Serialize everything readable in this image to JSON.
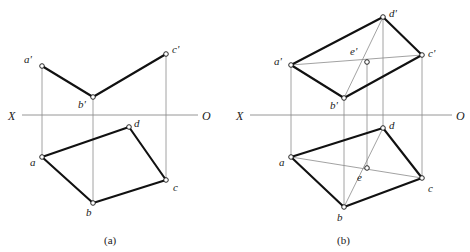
{
  "figure": {
    "colors": {
      "line_heavy": "#111111",
      "line_light": "#8a8a8a",
      "vertex_fill": "#ffffff",
      "vertex_stroke": "#111111",
      "text": "#1a1a1a"
    },
    "captions": [
      {
        "id": "caption-a",
        "text": "(a)",
        "x": 104,
        "y": 235
      },
      {
        "id": "caption-b",
        "text": "(b)",
        "x": 337,
        "y": 235
      }
    ]
  },
  "diagram_a": {
    "name": "diagram-a",
    "axis": {
      "label_x": "X",
      "label_o": "O",
      "y": 115,
      "x_start": 22,
      "x_end": 198,
      "label_x_pos": {
        "x": 8,
        "y": 110
      },
      "label_o_pos": {
        "x": 202,
        "y": 110
      }
    },
    "vertices": [
      {
        "id": "a-prime",
        "label": "a'",
        "x": 42,
        "y": 66,
        "lx": 24,
        "ly": 54
      },
      {
        "id": "c-prime",
        "label": "c'",
        "x": 166,
        "y": 54,
        "lx": 172,
        "ly": 44
      },
      {
        "id": "b-prime",
        "label": "b'",
        "x": 93,
        "y": 97,
        "lx": 78,
        "ly": 99
      },
      {
        "id": "a",
        "label": "a",
        "x": 42,
        "y": 157,
        "lx": 30,
        "ly": 157
      },
      {
        "id": "b",
        "label": "b",
        "x": 93,
        "y": 203,
        "lx": 86,
        "ly": 207
      },
      {
        "id": "c",
        "label": "c",
        "x": 166,
        "y": 180,
        "lx": 173,
        "ly": 182
      },
      {
        "id": "d",
        "label": "d",
        "x": 129,
        "y": 127,
        "lx": 134,
        "ly": 118
      }
    ],
    "heavy_edges": [
      {
        "id": "edge-ap-bp",
        "from": "a-prime",
        "to": "b-prime"
      },
      {
        "id": "edge-bp-cp",
        "from": "b-prime",
        "to": "c-prime"
      },
      {
        "id": "edge-a-b",
        "from": "a",
        "to": "b"
      },
      {
        "id": "edge-b-c",
        "from": "b",
        "to": "c"
      },
      {
        "id": "edge-c-d",
        "from": "c",
        "to": "d"
      },
      {
        "id": "edge-d-a",
        "from": "d",
        "to": "a"
      }
    ],
    "projector_lines": [
      {
        "id": "projector-a",
        "x": 42,
        "y1": 66,
        "y2": 157
      },
      {
        "id": "projector-b",
        "x": 93,
        "y1": 97,
        "y2": 203
      },
      {
        "id": "projector-c",
        "x": 166,
        "y1": 54,
        "y2": 180
      }
    ]
  },
  "diagram_b": {
    "name": "diagram-b",
    "axis": {
      "label_x": "X",
      "label_o": "O",
      "y": 115,
      "x_start": 250,
      "x_end": 452,
      "label_x_pos": {
        "x": 236,
        "y": 110
      },
      "label_o_pos": {
        "x": 456,
        "y": 110
      }
    },
    "vertices": [
      {
        "id": "a-prime",
        "label": "a'",
        "x": 291,
        "y": 65,
        "lx": 274,
        "ly": 56
      },
      {
        "id": "d-prime",
        "label": "d'",
        "x": 383,
        "y": 17,
        "lx": 389,
        "ly": 8
      },
      {
        "id": "c-prime",
        "label": "c'",
        "x": 422,
        "y": 55,
        "lx": 428,
        "ly": 48
      },
      {
        "id": "b-prime",
        "label": "b'",
        "x": 344,
        "y": 98,
        "lx": 330,
        "ly": 100
      },
      {
        "id": "e-prime",
        "label": "e'",
        "x": 367,
        "y": 62,
        "lx": 350,
        "ly": 46
      },
      {
        "id": "a",
        "label": "a",
        "x": 291,
        "y": 157,
        "lx": 279,
        "ly": 157
      },
      {
        "id": "d",
        "label": "d",
        "x": 383,
        "y": 128,
        "lx": 389,
        "ly": 120
      },
      {
        "id": "c",
        "label": "c",
        "x": 422,
        "y": 178,
        "lx": 428,
        "ly": 183
      },
      {
        "id": "b",
        "label": "b",
        "x": 344,
        "y": 207,
        "lx": 337,
        "ly": 212
      },
      {
        "id": "e",
        "label": "e",
        "x": 367,
        "y": 168,
        "lx": 357,
        "ly": 172
      }
    ],
    "heavy_edges": [
      {
        "id": "edge-ap-dp",
        "from": "a-prime",
        "to": "d-prime"
      },
      {
        "id": "edge-dp-cp",
        "from": "d-prime",
        "to": "c-prime"
      },
      {
        "id": "edge-cp-bp",
        "from": "c-prime",
        "to": "b-prime"
      },
      {
        "id": "edge-bp-ap",
        "from": "b-prime",
        "to": "a-prime"
      },
      {
        "id": "edge-a-d",
        "from": "a",
        "to": "d"
      },
      {
        "id": "edge-d-c",
        "from": "d",
        "to": "c"
      },
      {
        "id": "edge-c-b",
        "from": "c",
        "to": "b"
      },
      {
        "id": "edge-b-a",
        "from": "b",
        "to": "a"
      }
    ],
    "light_diagonals": [
      {
        "id": "diagonal-ap-cp",
        "from": "a-prime",
        "to": "c-prime"
      },
      {
        "id": "diagonal-bp-dp",
        "from": "b-prime",
        "to": "d-prime"
      },
      {
        "id": "diagonal-a-c",
        "from": "a",
        "to": "c"
      },
      {
        "id": "diagonal-b-d",
        "from": "b",
        "to": "d"
      }
    ],
    "projector_lines": [
      {
        "id": "projector-a",
        "x": 291,
        "y1": 65,
        "y2": 157
      },
      {
        "id": "projector-b",
        "x": 344,
        "y1": 98,
        "y2": 207
      },
      {
        "id": "projector-e",
        "x": 367,
        "y1": 62,
        "y2": 168
      },
      {
        "id": "projector-d",
        "x": 383,
        "y1": 17,
        "y2": 128
      },
      {
        "id": "projector-c",
        "x": 422,
        "y1": 55,
        "y2": 178
      }
    ]
  }
}
